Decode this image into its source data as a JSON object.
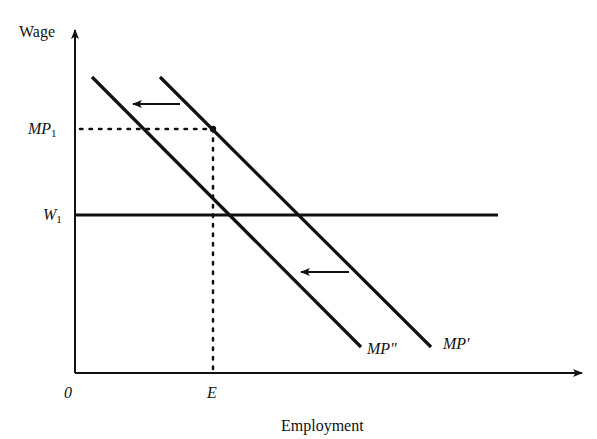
{
  "diagram": {
    "axes": {
      "y_label": "Wage",
      "x_label": "Employment",
      "origin_label": "0"
    },
    "levels": {
      "mp1": {
        "base": "MP",
        "sub": "1"
      },
      "w1": {
        "base": "W",
        "sub": "1"
      },
      "e": "E"
    },
    "curves": [
      {
        "id": "mp-prime",
        "label": "MP′"
      },
      {
        "id": "mp-double-prime",
        "label": "MP″"
      }
    ],
    "shift_arrows": {
      "count": 2,
      "direction": "left"
    },
    "colors": {
      "ink": "#111111",
      "background": "#ffffff"
    }
  }
}
